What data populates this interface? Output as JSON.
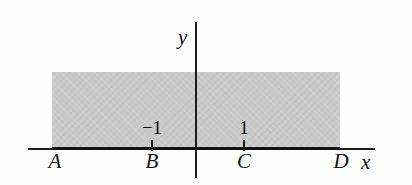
{
  "figure": {
    "background_color": "#ffffff",
    "shaded_color": "#c9c9c9",
    "axis_color": "#1b1b1b"
  },
  "axes": {
    "x_label": "x",
    "y_label": "y"
  },
  "tick_values": {
    "left": "−1",
    "right": "1"
  },
  "points": [
    {
      "id": "A",
      "label": "A"
    },
    {
      "id": "B",
      "label": "B"
    },
    {
      "id": "C",
      "label": "C"
    },
    {
      "id": "D",
      "label": "D"
    }
  ],
  "chart_data": {
    "type": "area",
    "title": "",
    "xlabel": "x",
    "ylabel": "y",
    "grid": false,
    "legend": "none",
    "xlim": [
      -3.1,
      2.1
    ],
    "ylim": [
      0,
      1.0
    ],
    "x_tick_labels": [
      "−1",
      "1"
    ],
    "x_tick_values": [
      -1,
      1
    ],
    "point_labels": [
      "A",
      "B",
      "C",
      "D"
    ],
    "point_values": [
      -2.75,
      -1,
      1,
      2.05
    ],
    "shaded_region": {
      "x_start": -2.75,
      "x_end": 2.05,
      "y_start": 0,
      "y_end": 0.84,
      "color": "#c9c9c9",
      "description": "Rectangular shaded band above the x-axis spanning from A to D"
    }
  }
}
